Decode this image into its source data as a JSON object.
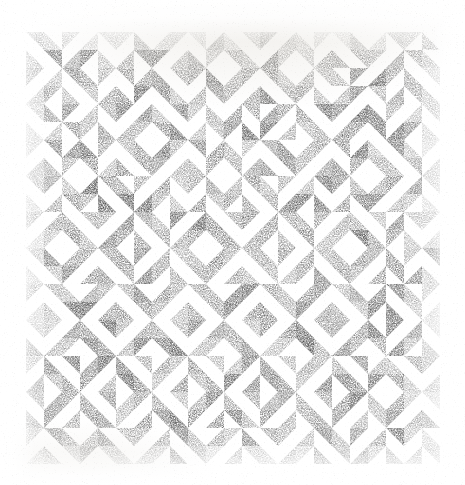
{
  "image": {
    "kind": "scanned-abstract-artwork",
    "title": "Half-Square Triangle Tiling",
    "medium_note": "stippled halftone print on white paper",
    "width": 465,
    "height": 485
  },
  "background": {
    "paper_color": "#ffffff",
    "scan_cast_color": "#e2ded6"
  },
  "pattern": {
    "name": "half-square-triangle-grid",
    "origin_x": 26,
    "origin_y": 32,
    "columns": 23,
    "rows": 24,
    "tile_size": 18,
    "ink_color": "#9a9a9a",
    "ink_color_dark": "#6f6f6f",
    "ink_color_light": "#c4c4c4",
    "fill_style": "stipple-halftone",
    "mean_coverage": 0.5,
    "orientation_options": [
      "tl",
      "tr",
      "br",
      "bl"
    ],
    "orientations": [
      "tr",
      "bl",
      "tl",
      "br",
      "tr",
      "tl",
      "bl",
      "br",
      "tl",
      "tr",
      "br",
      "bl",
      "tr",
      "tl",
      "br",
      "bl",
      "tl",
      "tr",
      "bl",
      "br",
      "tr",
      "tl",
      "bl",
      "bl",
      "tr",
      "br",
      "tl",
      "bl",
      "br",
      "tr",
      "tl",
      "br",
      "bl",
      "tl",
      "tr",
      "bl",
      "br",
      "tl",
      "tr",
      "br",
      "bl",
      "tr",
      "tl",
      "br",
      "tr",
      "bl",
      "tl",
      "br",
      "tr",
      "bl",
      "tl",
      "tr",
      "br",
      "bl",
      "tr",
      "tl",
      "bl",
      "br",
      "tl",
      "tr",
      "bl",
      "br",
      "tr",
      "bl",
      "tl",
      "br",
      "tl",
      "bl",
      "tr",
      "br",
      "tl",
      "bl",
      "tr",
      "br",
      "bl",
      "tl",
      "tr",
      "bl",
      "br",
      "tr",
      "tl",
      "br",
      "bl",
      "tr",
      "tl",
      "bl",
      "br",
      "tl",
      "tr",
      "br",
      "tr",
      "bl",
      "tr",
      "bl",
      "tl",
      "br",
      "tr",
      "tl",
      "br",
      "bl",
      "tr",
      "tl",
      "bl",
      "br",
      "tr",
      "br",
      "tl",
      "bl",
      "tr",
      "tl",
      "br",
      "bl",
      "tl",
      "br",
      "tr",
      "bl",
      "br",
      "tr",
      "tl",
      "bl",
      "br",
      "tl",
      "tr",
      "bl",
      "br",
      "tr",
      "tl",
      "bl",
      "tl",
      "br",
      "tr",
      "bl",
      "br",
      "tl",
      "tr",
      "br",
      "tl",
      "bl",
      "tl",
      "tr",
      "br",
      "bl",
      "tl",
      "tr",
      "bl",
      "br",
      "tl",
      "tr",
      "br",
      "bl",
      "tl",
      "tr",
      "bl",
      "br",
      "tl",
      "tr",
      "br",
      "bl",
      "tr",
      "bl",
      "tl",
      "br",
      "bl",
      "tl",
      "tr",
      "br",
      "bl",
      "tr",
      "tl",
      "br",
      "bl",
      "tl",
      "tr",
      "br",
      "bl",
      "tr",
      "tl",
      "br",
      "bl",
      "tl",
      "tr",
      "bl",
      "tr",
      "br",
      "tr",
      "tl",
      "bl",
      "br",
      "tr",
      "bl",
      "tl",
      "br",
      "tr",
      "tl",
      "bl",
      "br",
      "tr",
      "bl",
      "tl",
      "br",
      "tr",
      "tl",
      "bl",
      "br",
      "tl",
      "br",
      "tr",
      "bl",
      "br",
      "tr",
      "tl",
      "bl",
      "tr",
      "br",
      "tl",
      "bl",
      "br",
      "tr",
      "tl",
      "bl",
      "tr",
      "br",
      "tl",
      "bl",
      "br",
      "tr",
      "tl",
      "br",
      "tl",
      "bl",
      "tl",
      "br",
      "bl",
      "tr",
      "tl",
      "br",
      "tr",
      "bl",
      "tl",
      "br",
      "bl",
      "tr",
      "tl",
      "br",
      "tr",
      "bl",
      "tl",
      "br",
      "bl",
      "tr",
      "br",
      "tr",
      "tl",
      "br",
      "tl",
      "tr",
      "bl",
      "br",
      "tl",
      "bl",
      "tr",
      "br",
      "tl",
      "tr",
      "bl",
      "br",
      "tl",
      "bl",
      "tr",
      "br",
      "tl",
      "tr",
      "bl",
      "tl",
      "bl",
      "br",
      "tr",
      "bl",
      "br",
      "tl",
      "tr",
      "bl",
      "tl",
      "br",
      "tr",
      "bl",
      "br",
      "tl",
      "tr",
      "bl",
      "tl",
      "br",
      "tr",
      "bl",
      "br",
      "tl",
      "bl",
      "tl",
      "tr",
      "bl",
      "tr",
      "tl",
      "br",
      "bl",
      "tr",
      "br",
      "tl",
      "bl",
      "tr",
      "tl",
      "br",
      "bl",
      "tr",
      "br",
      "tl",
      "bl",
      "tr",
      "tl",
      "br",
      "tr",
      "br",
      "bl",
      "tl",
      "tr",
      "bl",
      "br",
      "tl",
      "tr",
      "bl",
      "br",
      "tl",
      "tr",
      "bl",
      "br",
      "tl",
      "tr",
      "bl",
      "br",
      "tl",
      "tr",
      "bl",
      "br",
      "tr",
      "bl",
      "tl",
      "br",
      "bl",
      "tr",
      "tl",
      "br",
      "bl",
      "tr",
      "tl",
      "br",
      "bl",
      "tr",
      "tl",
      "br",
      "bl",
      "tr",
      "tl",
      "br",
      "bl",
      "tr",
      "tl",
      "bl",
      "tr",
      "br",
      "tr",
      "tl",
      "br",
      "bl",
      "tr",
      "tl",
      "br",
      "bl",
      "tr",
      "tl",
      "br",
      "bl",
      "tr",
      "tl",
      "br",
      "bl",
      "tr",
      "tl",
      "br",
      "bl",
      "tl",
      "br",
      "tr",
      "bl",
      "br",
      "tl",
      "tr",
      "bl",
      "br",
      "tl",
      "tr",
      "bl",
      "br",
      "tl",
      "tr",
      "bl",
      "br",
      "tl",
      "tr",
      "bl",
      "br",
      "tl",
      "tr",
      "br",
      "tl",
      "bl",
      "tl",
      "bl",
      "tr",
      "br",
      "tl",
      "bl",
      "tr",
      "br",
      "tl",
      "bl",
      "tr",
      "br",
      "tl",
      "bl",
      "tr",
      "br",
      "tl",
      "bl",
      "tr",
      "br",
      "bl",
      "tr",
      "tl",
      "br",
      "tr",
      "bl",
      "tl",
      "br",
      "tr",
      "bl",
      "tl",
      "br",
      "tr",
      "bl",
      "tl",
      "br",
      "tr",
      "bl",
      "tl",
      "br",
      "tr",
      "bl",
      "tl",
      "tr",
      "bl",
      "br",
      "tr",
      "br",
      "tl",
      "bl",
      "tr",
      "br",
      "tl",
      "bl",
      "tr",
      "br",
      "tl",
      "bl",
      "tr",
      "br",
      "tl",
      "bl",
      "tr",
      "br",
      "tl",
      "bl",
      "br",
      "tl",
      "tr",
      "bl",
      "tl",
      "br",
      "tr",
      "bl",
      "tl",
      "br",
      "tr",
      "bl",
      "tl",
      "br",
      "tr",
      "bl",
      "tl",
      "br",
      "tr",
      "bl",
      "tl",
      "br",
      "tr",
      "tl",
      "br",
      "bl",
      "tl",
      "tr",
      "bl",
      "br",
      "bl",
      "tr",
      "tl",
      "br",
      "tr",
      "bl",
      "br",
      "tl",
      "bl",
      "tr",
      "tl",
      "br",
      "tr",
      "bl",
      "tl",
      "br",
      "tr",
      "tl",
      "bl",
      "br",
      "bl",
      "tr",
      "tl",
      "tr",
      "bl",
      "br",
      "tl",
      "bl",
      "tr",
      "tl",
      "br",
      "tr",
      "bl",
      "br",
      "tl",
      "bl",
      "tr",
      "br",
      "tl",
      "bl",
      "br",
      "tr"
    ]
  }
}
